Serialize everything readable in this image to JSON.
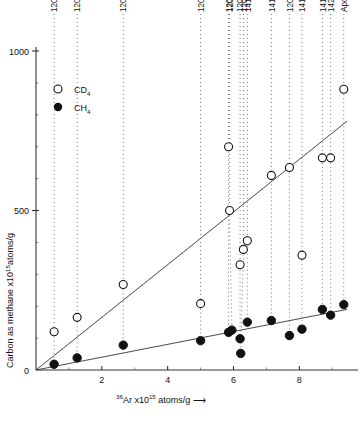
{
  "chart_data": {
    "type": "scatter",
    "title": "",
    "xlabel": "36Ar x1015 atoms/g",
    "xlabel_parts": {
      "pre_sup": "36",
      "element": "Ar",
      "times": "x10",
      "exp": "15",
      "post": "atoms/g",
      "arrow": "⟶"
    },
    "ylabel": "Carbon as methane x1015 atoms/g",
    "ylabel_parts": {
      "text": "Carbon as methane  x10",
      "exp": "15",
      "post": "atoms/g"
    },
    "xlim": [
      0,
      9.6
    ],
    "ylim": [
      0,
      1000
    ],
    "xticks": [
      2,
      4,
      6,
      8
    ],
    "xticklabels": [
      "2",
      "4",
      "6",
      "8"
    ],
    "yticks": [
      0,
      500,
      1000
    ],
    "yticklabels": [
      "0",
      "500",
      "1000"
    ],
    "grid": false,
    "legend_position": "upper-left-inset",
    "legend": [
      {
        "name": "CD4",
        "label_main": "CD",
        "label_sub": "4",
        "marker": "open-circle"
      },
      {
        "name": "CH4",
        "label_main": "CH",
        "label_sub": "4",
        "marker": "filled-circle"
      }
    ],
    "series": [
      {
        "name": "CD4",
        "marker": "open-circle",
        "points": [
          {
            "sample": "12033",
            "x": 0.55,
            "y": 120
          },
          {
            "sample": "12032",
            "x": 1.25,
            "y": 165
          },
          {
            "sample": "12028/24",
            "x": 2.65,
            "y": 268
          },
          {
            "sample": "12028/29",
            "x": 5.0,
            "y": 208
          },
          {
            "sample": "12025/3",
            "x": 5.85,
            "y": 700
          },
          {
            "sample": "12042",
            "x": 5.88,
            "y": 500
          },
          {
            "sample": "12070",
            "x": 6.2,
            "y": 330
          },
          {
            "sample": "12028/42",
            "x": 6.3,
            "y": 378
          },
          {
            "sample": "14149",
            "x": 6.42,
            "y": 405
          },
          {
            "sample": "14148",
            "x": 7.15,
            "y": 610
          },
          {
            "sample": "12001",
            "x": 7.7,
            "y": 635
          },
          {
            "sample": "14163",
            "x": 8.08,
            "y": 360
          },
          {
            "sample": "14156",
            "x": 8.7,
            "y": 665
          },
          {
            "sample": "14298",
            "x": 8.95,
            "y": 665
          },
          {
            "sample": "Apollo 11",
            "x": 9.35,
            "y": 880
          }
        ]
      },
      {
        "name": "CH4",
        "marker": "filled-circle",
        "points": [
          {
            "sample": "12033",
            "x": 0.55,
            "y": 18
          },
          {
            "sample": "12032",
            "x": 1.25,
            "y": 38
          },
          {
            "sample": "12028/24",
            "x": 2.65,
            "y": 78
          },
          {
            "sample": "12028/29",
            "x": 5.0,
            "y": 92
          },
          {
            "sample": "12025/3",
            "x": 5.85,
            "y": 118
          },
          {
            "sample": "12042",
            "x": 5.95,
            "y": 125
          },
          {
            "sample": "12070",
            "x": 6.2,
            "y": 98
          },
          {
            "sample": "12028/42",
            "x": 6.22,
            "y": 52
          },
          {
            "sample": "14149",
            "x": 6.42,
            "y": 150
          },
          {
            "sample": "14148",
            "x": 7.15,
            "y": 155
          },
          {
            "sample": "12001",
            "x": 7.7,
            "y": 108
          },
          {
            "sample": "14163",
            "x": 8.08,
            "y": 128
          },
          {
            "sample": "14156",
            "x": 8.7,
            "y": 190
          },
          {
            "sample": "14298",
            "x": 8.95,
            "y": 172
          },
          {
            "sample": "Apollo 11",
            "x": 9.35,
            "y": 205
          }
        ]
      }
    ],
    "fit_lines": [
      {
        "name": "CD4-fit",
        "x0": 0.0,
        "y0": 0,
        "x1": 9.45,
        "y1": 780
      },
      {
        "name": "CH4-fit",
        "x0": 0.0,
        "y0": 0,
        "x1": 9.45,
        "y1": 190
      }
    ],
    "sample_labels": [
      {
        "text": "12033",
        "x": 0.55,
        "drop_to_y": 120
      },
      {
        "text": "12032",
        "x": 1.25,
        "drop_to_y": 165
      },
      {
        "text": "12028/24",
        "x": 2.65,
        "drop_to_y": 268
      },
      {
        "text": "12028/29",
        "x": 5.0,
        "drop_to_y": 208
      },
      {
        "text": "12025/3",
        "x": 5.85,
        "drop_to_y": 700
      },
      {
        "text": "12042",
        "x": 5.88,
        "drop_to_y": 500
      },
      {
        "text": "12070",
        "x": 6.2,
        "drop_to_y": 330
      },
      {
        "text": "12028/42",
        "x": 6.3,
        "drop_to_y": 378
      },
      {
        "text": "14149",
        "x": 6.42,
        "drop_to_y": 405
      },
      {
        "text": "14148",
        "x": 7.15,
        "drop_to_y": 610
      },
      {
        "text": "12001",
        "x": 7.7,
        "drop_to_y": 635
      },
      {
        "text": "14163",
        "x": 8.08,
        "drop_to_y": 360
      },
      {
        "text": "14156",
        "x": 8.7,
        "drop_to_y": 665
      },
      {
        "text": "14298",
        "x": 8.95,
        "drop_to_y": 665
      },
      {
        "text": "Apollo 11",
        "x": 9.35,
        "drop_to_y": 880
      }
    ]
  }
}
